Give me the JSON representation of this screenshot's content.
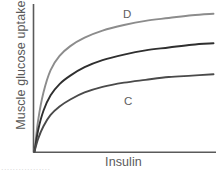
{
  "figure": {
    "name": "insulin-dose-response-curves",
    "background_color": "#ffffff",
    "axis_color": "#5a5a5a",
    "caption_remnant": "................."
  },
  "chart_data": {
    "type": "line",
    "title": "",
    "subtitle": "",
    "xlabel": "Insulin",
    "ylabel": "Muscle glucose uptake",
    "xlim": [
      0,
      100
    ],
    "ylim": [
      0,
      100
    ],
    "grid": false,
    "legend_position": "inline-annotations",
    "x_ticks": [],
    "y_ticks": [],
    "annotations": [
      {
        "text": "D",
        "x": 50,
        "y": 95,
        "series": "D"
      },
      {
        "text": "C",
        "x": 51,
        "y": 40,
        "series": "C"
      }
    ],
    "series": [
      {
        "name": "D",
        "label": "D",
        "color": "#8c8c8c",
        "description": "highest saturating response curve",
        "x": [
          0,
          2,
          5,
          9,
          14,
          20,
          28,
          38,
          50,
          62,
          75,
          88,
          100
        ],
        "y": [
          0,
          22,
          42,
          58,
          68,
          75,
          81,
          86,
          90,
          93,
          95,
          97,
          98
        ]
      },
      {
        "name": "middle",
        "label": "",
        "color": "#2f2f2f",
        "description": "intermediate saturating response curve",
        "x": [
          0,
          2,
          5,
          9,
          14,
          20,
          28,
          38,
          50,
          62,
          75,
          88,
          100
        ],
        "y": [
          0,
          15,
          29,
          40,
          48,
          54,
          60,
          65,
          69,
          72,
          74,
          76,
          77
        ]
      },
      {
        "name": "C",
        "label": "C",
        "color": "#4a4a4a",
        "description": "lowest saturating response curve",
        "x": [
          0,
          2,
          5,
          9,
          14,
          20,
          28,
          38,
          50,
          62,
          75,
          88,
          100
        ],
        "y": [
          0,
          9,
          18,
          26,
          32,
          37,
          42,
          46,
          49,
          51,
          53,
          54,
          55
        ]
      }
    ]
  }
}
